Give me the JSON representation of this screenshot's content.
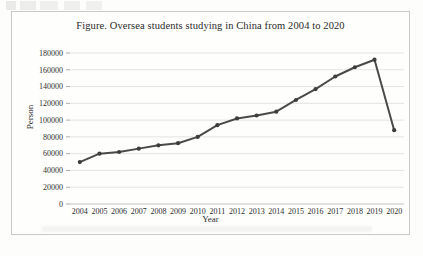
{
  "chart_data": {
    "type": "line",
    "title": "Figure. Oversea students studying in China from 2004 to 2020",
    "xlabel": "Year",
    "ylabel": "Person",
    "categories": [
      "2004",
      "2005",
      "2006",
      "2007",
      "2008",
      "2009",
      "2010",
      "2011",
      "2012",
      "2013",
      "2014",
      "2015",
      "2016",
      "2017",
      "2018",
      "2019",
      "2020"
    ],
    "values": [
      50000,
      60000,
      62000,
      66000,
      70000,
      72500,
      80000,
      94000,
      102000,
      105500,
      110000,
      124000,
      137000,
      152000,
      163000,
      172000,
      88000
    ],
    "ylim": [
      0,
      180000
    ],
    "ytick_labels": [
      "180000",
      "160000",
      "140000",
      "120000",
      "100000",
      "80000",
      "60000",
      "40000",
      "20000",
      "0"
    ],
    "ytick_values": [
      180000,
      160000,
      140000,
      120000,
      100000,
      80000,
      60000,
      40000,
      20000,
      0
    ],
    "grid": true,
    "legend": false,
    "series_color": "#4a4a4a",
    "gridline_color": "#d8d8d8",
    "frame_color": "#c9c9c9"
  }
}
